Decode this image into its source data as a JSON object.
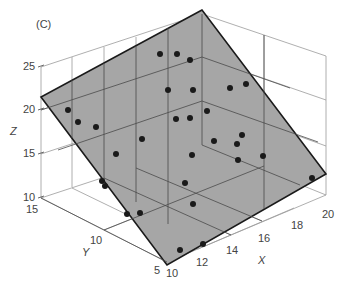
{
  "chart_data": {
    "type": "scatter",
    "subtype": "3d-scatter-with-regression-plane",
    "panel_label": "(C)",
    "xlabel": "X",
    "ylabel": "Y",
    "zlabel": "Z",
    "x_ticks": [
      "10",
      "12",
      "14",
      "16",
      "18",
      "20"
    ],
    "y_ticks": [
      "5",
      "10",
      "15"
    ],
    "z_ticks": [
      "10",
      "15",
      "20",
      "25"
    ],
    "xlim": [
      10,
      20
    ],
    "ylim": [
      5,
      15
    ],
    "zlim": [
      10,
      25
    ],
    "grid": true,
    "plane_color": "#a6a6a6",
    "plane_edge_color": "#1a1a1a",
    "point_color": "#1a1a1a",
    "points_screen_px": [
      [
        160,
        54
      ],
      [
        177,
        54
      ],
      [
        190,
        60
      ],
      [
        168,
        90
      ],
      [
        193,
        90
      ],
      [
        230,
        88
      ],
      [
        246,
        84
      ],
      [
        207,
        111
      ],
      [
        176,
        119
      ],
      [
        190,
        118
      ],
      [
        242,
        135
      ],
      [
        142,
        139
      ],
      [
        68,
        110
      ],
      [
        78,
        122
      ],
      [
        96,
        127
      ],
      [
        116,
        154
      ],
      [
        192,
        155
      ],
      [
        214,
        141
      ],
      [
        237,
        144
      ],
      [
        238,
        160
      ],
      [
        263,
        156
      ],
      [
        312,
        178
      ],
      [
        102,
        181
      ],
      [
        105,
        186
      ],
      [
        185,
        183
      ],
      [
        193,
        204
      ],
      [
        127,
        214
      ],
      [
        140,
        213
      ],
      [
        180,
        250
      ],
      [
        203,
        244
      ]
    ]
  }
}
